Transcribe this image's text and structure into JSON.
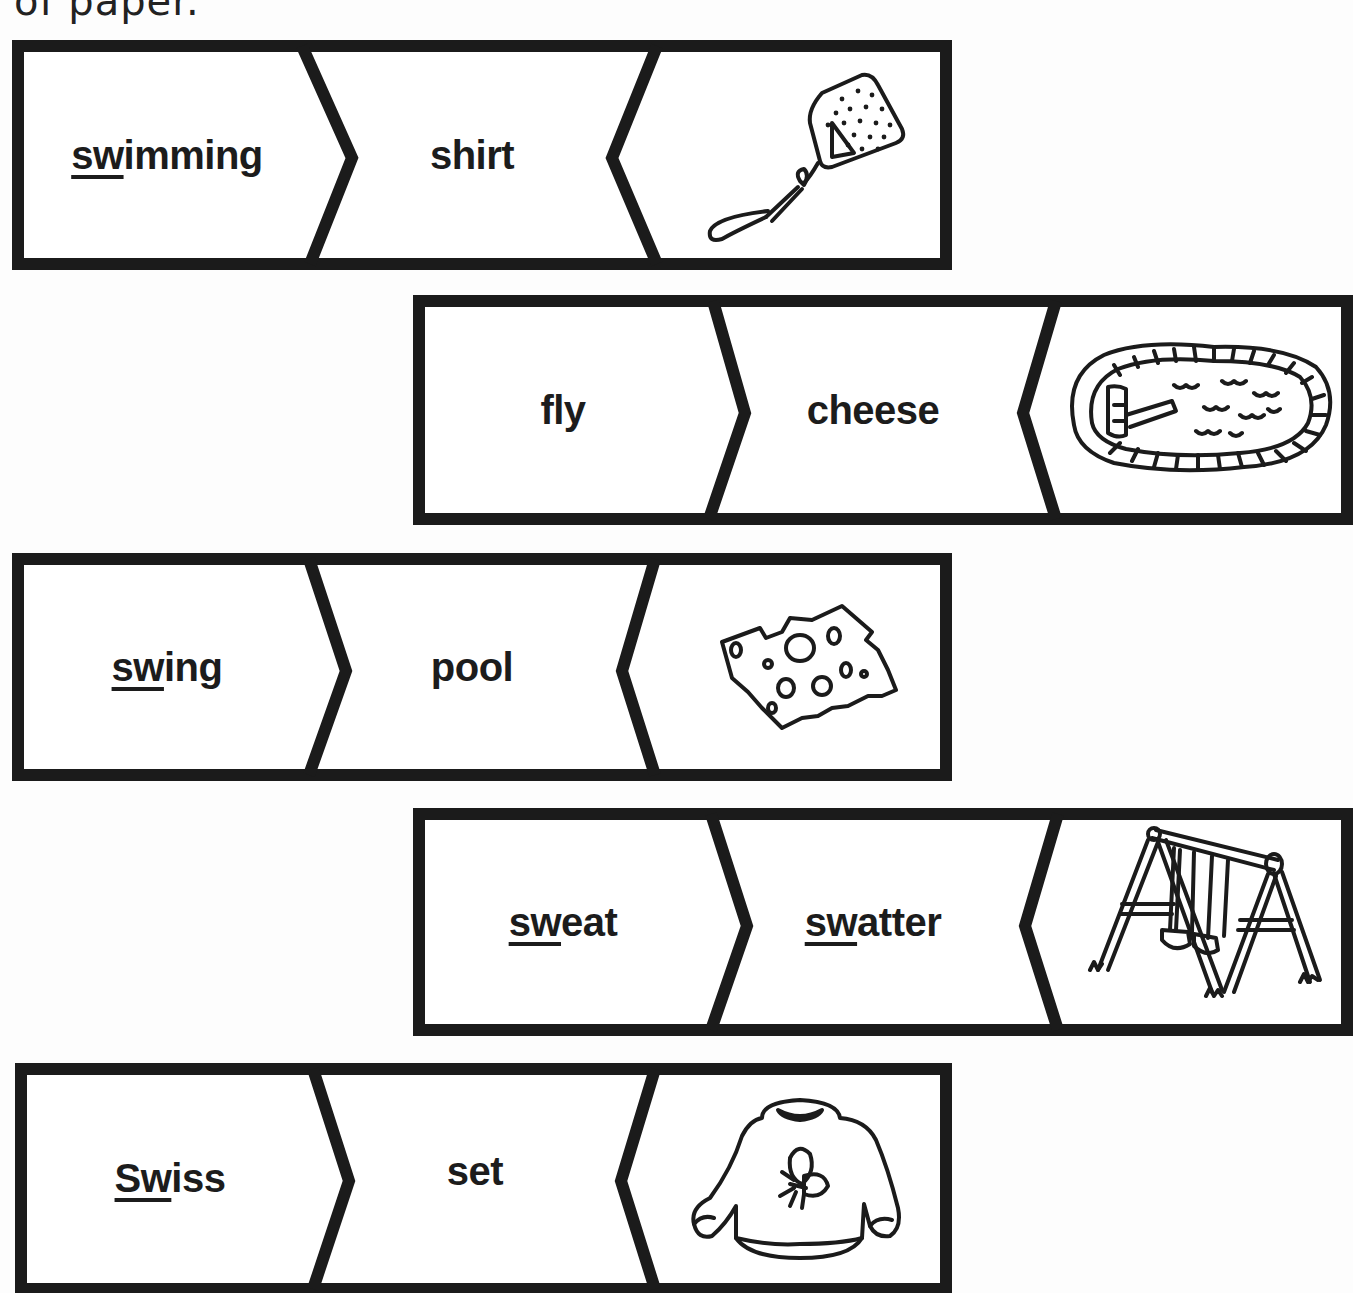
{
  "page": {
    "instruction_fragment": "of paper."
  },
  "colors": {
    "ink": "#1b1b1b",
    "paper": "#fdfdfd"
  },
  "strips": [
    {
      "id": 1,
      "word1": {
        "underlined": "sw",
        "rest": "imming"
      },
      "word2": {
        "underlined": "",
        "rest": "shirt"
      },
      "picture": "fly-swatter-icon"
    },
    {
      "id": 2,
      "word1": {
        "underlined": "",
        "rest": "fly"
      },
      "word2": {
        "underlined": "",
        "rest": "cheese"
      },
      "picture": "swimming-pool-icon"
    },
    {
      "id": 3,
      "word1": {
        "underlined": "sw",
        "rest": "ing"
      },
      "word2": {
        "underlined": "",
        "rest": "pool"
      },
      "picture": "swiss-cheese-icon"
    },
    {
      "id": 4,
      "word1": {
        "underlined": "sw",
        "rest": "eat"
      },
      "word2": {
        "underlined": "sw",
        "rest": "atter"
      },
      "picture": "swing-set-icon"
    },
    {
      "id": 5,
      "word1": {
        "underlined": "Sw",
        "rest": "iss"
      },
      "word2": {
        "underlined": "",
        "rest": "set"
      },
      "picture": "sweatshirt-icon"
    }
  ]
}
